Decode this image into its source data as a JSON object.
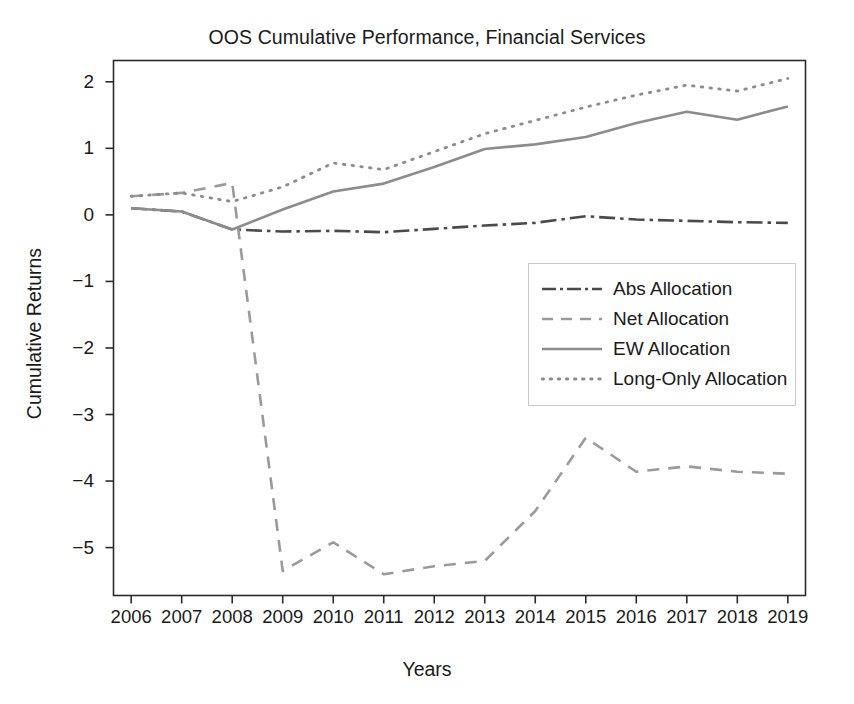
{
  "chart_data": {
    "type": "line",
    "title": "OOS Cumulative Performance, Financial Services",
    "xlabel": "Years",
    "ylabel": "Cumulative Returns",
    "grid": false,
    "legend_position": "center-right",
    "x": [
      2006,
      2007,
      2008,
      2009,
      2010,
      2011,
      2012,
      2013,
      2014,
      2015,
      2016,
      2017,
      2018,
      2019
    ],
    "xtick_labels": [
      "2006",
      "2007",
      "2008",
      "2009",
      "2010",
      "2011",
      "2012",
      "2013",
      "2014",
      "2015",
      "2016",
      "2017",
      "2018",
      "2019"
    ],
    "ytick_labels": [
      "2",
      "1",
      "0",
      "−1",
      "−2",
      "−3",
      "−4",
      "−5"
    ],
    "ytick_values": [
      2,
      1,
      0,
      -1,
      -2,
      -3,
      -4,
      -5
    ],
    "xlim": [
      2005.65,
      2019.35
    ],
    "ylim": [
      -5.72,
      2.32
    ],
    "series": [
      {
        "name": "Abs Allocation",
        "style": "dashdot",
        "color": "#4a4a4a",
        "width": 2.6,
        "values": [
          0.1,
          0.05,
          -0.22,
          -0.25,
          -0.24,
          -0.26,
          -0.21,
          -0.16,
          -0.12,
          -0.02,
          -0.07,
          -0.09,
          -0.11,
          -0.12
        ]
      },
      {
        "name": "Net Allocation",
        "style": "dashed",
        "color": "#9a9a9a",
        "width": 2.6,
        "values": [
          0.28,
          0.33,
          0.48,
          -5.35,
          -4.92,
          -5.4,
          -5.28,
          -5.2,
          -4.45,
          -3.35,
          -3.86,
          -3.78,
          -3.86,
          -3.89
        ]
      },
      {
        "name": "EW Allocation",
        "style": "solid",
        "color": "#8c8c8c",
        "width": 2.6,
        "values": [
          0.1,
          0.05,
          -0.22,
          0.08,
          0.35,
          0.47,
          0.72,
          0.99,
          1.06,
          1.17,
          1.38,
          1.55,
          1.43,
          1.63
        ]
      },
      {
        "name": "Long-Only Allocation",
        "style": "dotted",
        "color": "#8c8c8c",
        "width": 2.8,
        "values": [
          0.28,
          0.33,
          0.2,
          0.42,
          0.78,
          0.68,
          0.95,
          1.22,
          1.42,
          1.62,
          1.8,
          1.95,
          1.86,
          2.05
        ]
      }
    ]
  },
  "legend": {
    "items": [
      {
        "label": "Abs Allocation"
      },
      {
        "label": "Net Allocation"
      },
      {
        "label": "EW Allocation"
      },
      {
        "label": "Long-Only Allocation"
      }
    ]
  }
}
